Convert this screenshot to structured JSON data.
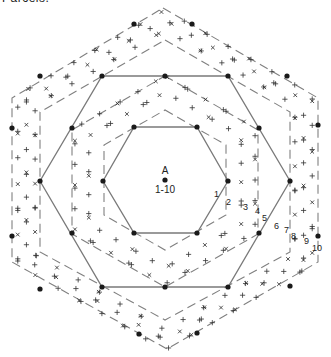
{
  "title_cropped": "Parcels.",
  "colors": {
    "ink": "#1a1a1a",
    "solid_line": "#7a7a7a",
    "dashed_line": "#808080",
    "cross": "#333333",
    "background": "#ffffff"
  },
  "center": {
    "label": "A",
    "sublabel": "1-10",
    "x": 165,
    "y": 180
  },
  "ring_labels": [
    {
      "text": "1",
      "x": 214,
      "y": 197
    },
    {
      "text": "2",
      "x": 226,
      "y": 205
    },
    {
      "text": "3",
      "x": 243,
      "y": 210
    },
    {
      "text": "4",
      "x": 255,
      "y": 214
    },
    {
      "text": "5",
      "x": 262,
      "y": 221
    },
    {
      "text": "6",
      "x": 274,
      "y": 229
    },
    {
      "text": "7",
      "x": 284,
      "y": 233
    },
    {
      "text": "8",
      "x": 291,
      "y": 239
    },
    {
      "text": "9",
      "x": 304,
      "y": 244
    },
    {
      "text": "10",
      "x": 312,
      "y": 251
    }
  ],
  "hexagons": {
    "solid_inner": [
      [
        134,
        127
      ],
      [
        197,
        127
      ],
      [
        228,
        181
      ],
      [
        197,
        233
      ],
      [
        134,
        233
      ],
      [
        103,
        181
      ]
    ],
    "solid_outer": [
      [
        102,
        76
      ],
      [
        228,
        76
      ],
      [
        290,
        181
      ],
      [
        228,
        287
      ],
      [
        102,
        287
      ],
      [
        40,
        181
      ]
    ],
    "dashed_inner": [
      [
        165,
        110
      ],
      [
        226,
        145
      ],
      [
        226,
        215
      ],
      [
        165,
        250
      ],
      [
        104,
        215
      ],
      [
        104,
        145
      ]
    ],
    "dashed_mid": [
      [
        165,
        76
      ],
      [
        258,
        130
      ],
      [
        258,
        234
      ],
      [
        165,
        287
      ],
      [
        72,
        234
      ],
      [
        72,
        130
      ]
    ],
    "dashed_middle2": [
      [
        165,
        40
      ],
      [
        290,
        112
      ],
      [
        290,
        252
      ],
      [
        165,
        320
      ],
      [
        40,
        252
      ],
      [
        40,
        112
      ]
    ],
    "dashed_outer": [
      [
        163,
        8
      ],
      [
        318,
        98
      ],
      [
        318,
        262
      ],
      [
        167,
        349
      ],
      [
        12,
        262
      ],
      [
        12,
        98
      ]
    ]
  },
  "dots": [
    [
      165,
      180
    ],
    [
      134,
      127
    ],
    [
      197,
      127
    ],
    [
      228,
      181
    ],
    [
      197,
      233
    ],
    [
      134,
      233
    ],
    [
      103,
      181
    ],
    [
      102,
      76
    ],
    [
      228,
      76
    ],
    [
      290,
      181
    ],
    [
      228,
      287
    ],
    [
      102,
      287
    ],
    [
      40,
      181
    ],
    [
      134,
      24
    ],
    [
      192,
      24
    ],
    [
      287,
      76
    ],
    [
      318,
      125
    ],
    [
      318,
      236
    ],
    [
      290,
      286
    ],
    [
      197,
      333
    ],
    [
      139,
      334
    ],
    [
      40,
      289
    ],
    [
      12,
      236
    ],
    [
      12,
      128
    ],
    [
      40,
      76
    ],
    [
      165,
      76
    ],
    [
      259,
      128
    ],
    [
      259,
      233
    ],
    [
      165,
      287
    ],
    [
      72,
      233
    ],
    [
      72,
      128
    ]
  ],
  "cross_rings": [
    {
      "r": 88,
      "count": 36
    },
    {
      "r": 104,
      "count": 40
    },
    {
      "r": 150,
      "count": 52
    },
    {
      "r": 160,
      "count": 56
    },
    {
      "r": 170,
      "count": 56
    }
  ]
}
